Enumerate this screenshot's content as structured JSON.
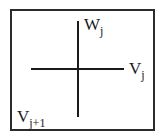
{
  "diagram": {
    "labels": {
      "w": {
        "base": "W",
        "sub": "j"
      },
      "v": {
        "base": "V",
        "sub": "j"
      },
      "v_next": {
        "base": "V",
        "sub": "j+1"
      }
    }
  }
}
